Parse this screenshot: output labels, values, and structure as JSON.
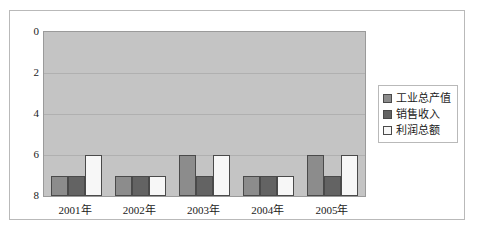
{
  "chart_data": {
    "type": "bar",
    "title": "",
    "xlabel": "",
    "ylabel": "",
    "categories": [
      "2001年",
      "2002年",
      "2003年",
      "2004年",
      "2005年"
    ],
    "series": [
      {
        "name": "工业总产值",
        "color": "#8c8c8c",
        "values": [
          7,
          7,
          6,
          7,
          6
        ]
      },
      {
        "name": "销售收入",
        "color": "#636363",
        "values": [
          7,
          7,
          7,
          7,
          7
        ]
      },
      {
        "name": "利润总额",
        "color": "#f7f7f7",
        "values": [
          6,
          7,
          6,
          7,
          6
        ]
      }
    ],
    "ylim": [
      0,
      8
    ],
    "y_inverted": true,
    "yticks": [
      0,
      2,
      4,
      6,
      8
    ],
    "ytick_labels": [
      "0",
      "2",
      "4",
      "6",
      "8"
    ],
    "grid": true,
    "grid_axis": "y",
    "legend_position": "right",
    "plot_background": "#c4c4c4",
    "bar_border_color": "#4a4a4a"
  }
}
